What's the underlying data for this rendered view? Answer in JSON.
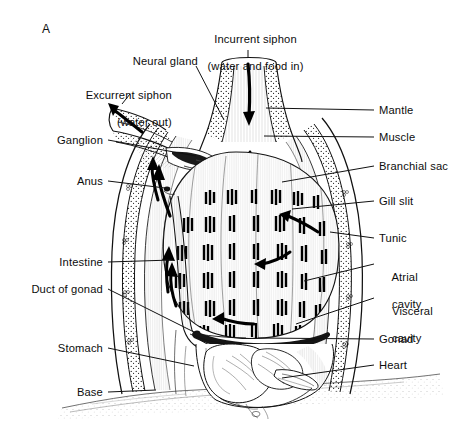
{
  "figure": {
    "panel_tag": "A",
    "style": "line-drawing",
    "background_color": "#ffffff",
    "ink_color": "#000000"
  },
  "callouts": {
    "incurrent_siphon": {
      "line1": "Incurrent siphon",
      "line2": "(water and food in)"
    },
    "excurrent_siphon": {
      "line1": "Excurrent siphon",
      "line2": "(water out)"
    },
    "neural_gland": "Neural gland",
    "ganglion": "Ganglion",
    "anus": "Anus",
    "intestine": "Intestine",
    "duct_of_gonad": "Duct of gonad",
    "stomach": "Stomach",
    "base": "Base",
    "mantle": "Mantle",
    "muscle": "Muscle",
    "branchial_sac": "Branchial sac",
    "gill_slit": "Gill slit",
    "tunic": "Tunic",
    "atrial_cavity": {
      "line1": "Atrial",
      "line2": "cavity"
    },
    "visceral_cavity": {
      "line1": "Visceral",
      "line2": "cavity"
    },
    "gonad": "Gonad",
    "heart": "Heart"
  }
}
